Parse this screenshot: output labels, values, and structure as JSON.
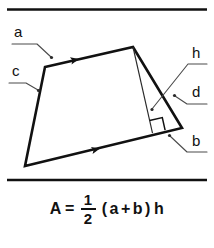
{
  "figure": {
    "title_alt": "Area of a trapezoid diagram",
    "stroke_color": "#111111",
    "leader_color": "#4a4a4a",
    "background": "#ffffff",
    "rules": [
      {
        "name": "top-rule",
        "x1": 7,
        "y1": 9.5,
        "x2": 207,
        "y2": 9.5
      },
      {
        "name": "bottom-rule",
        "x1": 7,
        "y1": 180,
        "x2": 207,
        "y2": 180
      }
    ],
    "trapezoid": {
      "vertices": [
        {
          "name": "top-left",
          "x": 45,
          "y": 67
        },
        {
          "name": "top-right",
          "x": 133,
          "y": 47
        },
        {
          "name": "bottom-right",
          "x": 182,
          "y": 128
        },
        {
          "name": "bottom-left",
          "x": 25,
          "y": 166
        }
      ],
      "parallel_marks": [
        {
          "name": "arrow-top-side",
          "x": 78,
          "y": 59.3,
          "angle": -12.8
        },
        {
          "name": "arrow-bottom-side",
          "x": 99,
          "y": 148.6,
          "angle": -13.8
        }
      ],
      "height_line": {
        "from_x": 133,
        "from_y": 47,
        "to_x": 152.5,
        "to_y": 133.2
      },
      "right_angle_marker": {
        "x": 152,
        "y": 119,
        "size": 13
      }
    },
    "labels": [
      {
        "id": "a",
        "text": "a",
        "text_x": 14,
        "text_y": 37,
        "leader": "M 12 44 L 37 44 L 51 57",
        "dot_x": 51.5,
        "dot_y": 57.5
      },
      {
        "id": "c",
        "text": "c",
        "text_x": 12,
        "text_y": 76,
        "leader": "M 9 83 L 26 83 L 38 90",
        "dot_x": 38.5,
        "dot_y": 90.5
      },
      {
        "id": "h",
        "text": "h",
        "text_x": 192,
        "text_y": 58,
        "leader": "M 207 64 L 188 64 L 152 109",
        "dot_x": 152,
        "dot_y": 109.5
      },
      {
        "id": "d",
        "text": "d",
        "text_x": 192,
        "text_y": 97,
        "leader": "M 207 104 L 187 104 L 175 96",
        "dot_x": 174.5,
        "dot_y": 95.5
      },
      {
        "id": "b",
        "text": "b",
        "text_x": 192,
        "text_y": 146,
        "leader": "M 207 152 L 187 152 L 170 136",
        "dot_x": 169.5,
        "dot_y": 135.5
      }
    ]
  },
  "formula": {
    "lhs": "A",
    "equals": "=",
    "fraction": {
      "numerator": "1",
      "denominator": "2"
    },
    "open_paren": "(",
    "term_a": "a",
    "plus": "+",
    "term_b": "b",
    "close_paren": ")",
    "term_h": "h",
    "full_text": "A = 1/2 ( a + b ) h"
  }
}
